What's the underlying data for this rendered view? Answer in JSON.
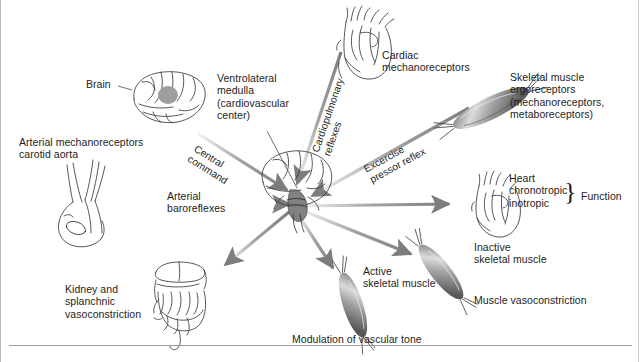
{
  "figure": {
    "background_color": "#ffffff",
    "arrow_color": "#8c8c8c",
    "line_color": "#3a3a3a",
    "text_color": "#1d1d1d"
  },
  "labels": {
    "brain": "Brain",
    "arterial_mechanoreceptors": "Arterial mechanoreceptors\ncarotid aorta",
    "ventrolateral_medulla": "Ventrolateral\nmedulla\n(cardiovascular\ncenter)",
    "cardiac_mechanoreceptors": "Cardiac\nmechanoreceptors",
    "skeletal_muscle_ergoreceptors": "Skeletal muscle\nergoreceptors\n(mechanoreceptors,\nmetaboreceptors)",
    "heart_function": "Heart\nchronotropic\ninotropic",
    "function_brace_label": "Function",
    "inactive_skeletal_muscle": "Inactive\nskeletal muscle",
    "muscle_vasoconstriction": "Muscle vasoconstriction",
    "active_skeletal_muscle": "Active\nskeletal muscle",
    "modulation_of_vascular_tone": "Modulation of vascular tone",
    "kidney_splanchnic": "Kidney and\nsplanchnic\nvasoconstriction"
  },
  "arrow_labels": {
    "central_command": "Central\ncommand",
    "cardiopulmonary_reflexes": "Cardiopulmonary\nreflexes",
    "excercise_pressor_reflex": "Excercise\npressor reflex",
    "arterial_baroreflexes": "Arterial\nbaroreflexes"
  },
  "illustrations": {
    "brain": "brain-lateral-illustration",
    "carotid_aorta": "carotid-aorta-illustration",
    "heart_top": "heart-illustration",
    "heart_right": "heart-illustration",
    "muscle_ergoreceptor": "skeletal-muscle-fiber-illustration",
    "muscle_inactive": "skeletal-muscle-fiber-illustration",
    "muscle_active": "skeletal-muscle-fiber-illustration",
    "viscera": "kidney-splanchnic-viscera-illustration",
    "brainstem_hub": "brain-brainstem-hub-illustration"
  }
}
